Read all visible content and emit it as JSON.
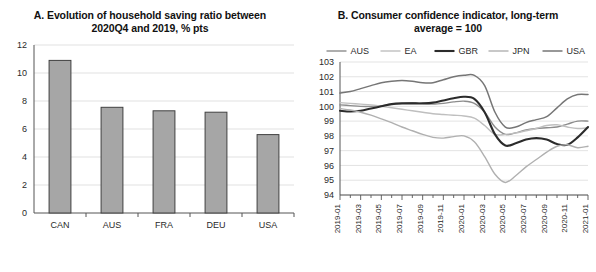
{
  "panel_a": {
    "title_line1": "A. Evolution of household saving ratio between",
    "title_line2": "2020Q4 and 2019, % pts",
    "chart_data": {
      "type": "bar",
      "title": "A. Evolution of household saving ratio between 2020Q4 and 2019, % pts",
      "xlabel": "",
      "ylabel": "",
      "ylim": [
        0,
        12
      ],
      "yticks": [
        0,
        2,
        4,
        6,
        8,
        10,
        12
      ],
      "grid": true,
      "legend": "none",
      "categories": [
        "CAN",
        "AUS",
        "FRA",
        "DEU",
        "USA"
      ],
      "values": [
        10.9,
        7.55,
        7.3,
        7.2,
        5.6
      ],
      "bar_fill": "#a6a6a6",
      "bar_stroke": "#404040"
    }
  },
  "panel_b": {
    "title_line1": "B. Consumer confidence indicator, long-term",
    "title_line2": "average = 100",
    "chart_data": {
      "type": "line",
      "title": "B. Consumer confidence indicator, long-term average = 100",
      "xlabel": "",
      "ylabel": "",
      "ylim": [
        94,
        103
      ],
      "yticks": [
        94,
        95,
        96,
        97,
        98,
        99,
        100,
        101,
        102,
        103
      ],
      "grid": true,
      "legend": "top",
      "x": [
        "2019-01",
        "2019-02",
        "2019-03",
        "2019-04",
        "2019-05",
        "2019-06",
        "2019-07",
        "2019-08",
        "2019-09",
        "2019-10",
        "2019-11",
        "2019-12",
        "2020-01",
        "2020-02",
        "2020-03",
        "2020-04",
        "2020-05",
        "2020-06",
        "2020-07",
        "2020-08",
        "2020-09",
        "2020-10",
        "2020-11",
        "2020-12",
        "2021-01"
      ],
      "xtick_labels": [
        "2019-01",
        "2019-03",
        "2019-05",
        "2019-07",
        "2019-09",
        "2019-11",
        "2020-01",
        "2020-03",
        "2020-05",
        "2020-07",
        "2020-09",
        "2020-11",
        "2021-01"
      ],
      "series": [
        {
          "name": "AUS",
          "color": "#8c8c8c",
          "width": 1.4,
          "values": [
            100.1,
            100.05,
            100.0,
            100.0,
            100.05,
            100.15,
            100.2,
            100.25,
            100.2,
            100.15,
            100.2,
            100.3,
            100.35,
            100.2,
            99.6,
            98.6,
            98.1,
            98.2,
            98.4,
            98.5,
            98.55,
            98.6,
            98.8,
            99.0,
            99.0
          ]
        },
        {
          "name": "EA",
          "color": "#bfbfbf",
          "width": 1.4,
          "values": [
            100.25,
            100.2,
            100.15,
            100.1,
            100.0,
            99.9,
            99.8,
            99.7,
            99.6,
            99.5,
            99.45,
            99.4,
            99.35,
            99.2,
            98.7,
            98.1,
            98.1,
            98.2,
            98.35,
            98.5,
            98.7,
            98.75,
            98.6,
            98.5,
            98.55
          ]
        },
        {
          "name": "GBR",
          "color": "#2b2b2b",
          "width": 2.1,
          "values": [
            99.7,
            99.65,
            99.7,
            99.85,
            100.0,
            100.15,
            100.2,
            100.2,
            100.2,
            100.25,
            100.4,
            100.55,
            100.65,
            100.5,
            99.6,
            98.1,
            97.35,
            97.5,
            97.75,
            97.85,
            97.75,
            97.45,
            97.4,
            97.9,
            98.6
          ]
        },
        {
          "name": "JPN",
          "color": "#b0b0b0",
          "width": 1.4,
          "values": [
            99.85,
            99.75,
            99.6,
            99.4,
            99.15,
            98.9,
            98.6,
            98.35,
            98.1,
            97.9,
            97.85,
            97.95,
            98.0,
            97.6,
            96.6,
            95.4,
            94.85,
            95.3,
            95.9,
            96.4,
            96.9,
            97.3,
            97.4,
            97.2,
            97.3
          ]
        },
        {
          "name": "USA",
          "color": "#767676",
          "width": 1.5,
          "values": [
            100.9,
            101.0,
            101.2,
            101.4,
            101.6,
            101.7,
            101.75,
            101.7,
            101.6,
            101.6,
            101.8,
            102.0,
            102.1,
            102.1,
            101.4,
            99.6,
            98.6,
            98.6,
            98.9,
            99.1,
            99.3,
            99.9,
            100.5,
            100.8,
            100.8
          ]
        }
      ]
    }
  }
}
